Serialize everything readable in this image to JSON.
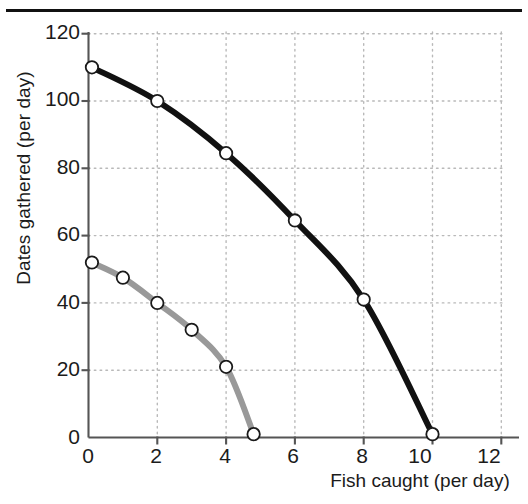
{
  "chart_data": {
    "type": "line",
    "title": "",
    "subtitle": "",
    "xlabel": "Fish caught (per day)",
    "ylabel": "Dates gathered (per day)",
    "xlim": [
      0,
      13.2
    ],
    "ylim": [
      0,
      123
    ],
    "xticks": [
      0,
      2,
      4,
      6,
      8,
      10,
      12
    ],
    "xticklabels": [
      "0",
      "2",
      "4",
      "6",
      "8",
      "10",
      "12"
    ],
    "yticks": [
      0,
      20,
      40,
      60,
      80,
      100,
      120
    ],
    "yticklabels": [
      "0",
      "20",
      "40",
      "60",
      "80",
      "100",
      "120"
    ],
    "grid": true,
    "grid_style": "dotted",
    "legend": "none",
    "series": [
      {
        "name": "outer-frontier",
        "color": "#111111",
        "marker": "open-circle",
        "linewidth": 6,
        "x": [
          0.1,
          2,
          4,
          6,
          8,
          10
        ],
        "y": [
          110,
          100,
          84.5,
          64.5,
          41,
          1
        ]
      },
      {
        "name": "inner-frontier",
        "color": "#999999",
        "marker": "open-circle",
        "linewidth": 6,
        "x": [
          0.1,
          1,
          2,
          3,
          4,
          4.8
        ],
        "y": [
          52,
          47.5,
          40,
          32,
          21,
          1
        ]
      }
    ]
  },
  "figure": {
    "has_top_rule": true,
    "background": "#ffffff",
    "axis_color": "#555555",
    "gridline_color": "#b9b9b9",
    "text_color": "#1b1b1b"
  }
}
